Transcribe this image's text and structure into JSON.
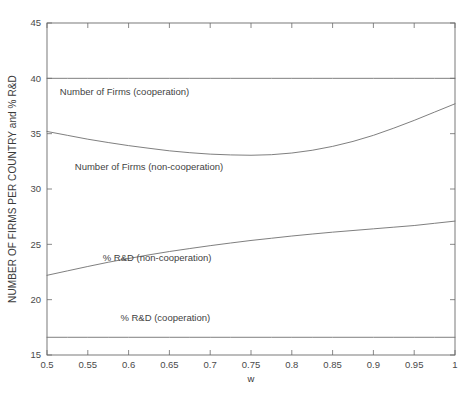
{
  "chart_data": {
    "type": "line",
    "title": "",
    "xlabel": "w",
    "ylabel": "NUMBER OF FIRMS PER COUNTRY and % R&D",
    "xlim": [
      0.5,
      1.0
    ],
    "ylim": [
      15,
      45
    ],
    "xticks": [
      0.5,
      0.55,
      0.6,
      0.65,
      0.7,
      0.75,
      0.8,
      0.85,
      0.9,
      0.95,
      1
    ],
    "xticklabels": [
      "0.5",
      "0.55",
      "0.6",
      "0.65",
      "0.7",
      "0.75",
      "0.8",
      "0.85",
      "0.9",
      "0.95",
      "1"
    ],
    "yticks": [
      15,
      20,
      25,
      30,
      35,
      40,
      45
    ],
    "yticklabels": [
      "15",
      "20",
      "25",
      "30",
      "35",
      "40",
      "45"
    ],
    "grid": false,
    "legend_position": "inline-annotations",
    "line_color": "#707070",
    "axis_color": "#6b6b6b",
    "background": "#ffffff",
    "x": [
      0.5,
      0.525,
      0.55,
      0.575,
      0.6,
      0.625,
      0.65,
      0.675,
      0.7,
      0.725,
      0.75,
      0.775,
      0.8,
      0.825,
      0.85,
      0.875,
      0.9,
      0.925,
      0.95,
      0.975,
      1.0
    ],
    "series": [
      {
        "name": "Number of Firms (cooperation)",
        "values": [
          40,
          40,
          40,
          40,
          40,
          40,
          40,
          40,
          40,
          40,
          40,
          40,
          40,
          40,
          40,
          40,
          40,
          40,
          40,
          40,
          40
        ],
        "annotation": {
          "text": "Number of Firms (cooperation)",
          "x": 0.595,
          "y": 38.45
        }
      },
      {
        "name": "Number of Firms (non-cooperation)",
        "values": [
          35.2,
          34.85,
          34.5,
          34.2,
          33.92,
          33.68,
          33.45,
          33.28,
          33.15,
          33.08,
          33.05,
          33.1,
          33.25,
          33.5,
          33.85,
          34.3,
          34.85,
          35.5,
          36.2,
          36.95,
          37.7
        ],
        "annotation": {
          "text": "Number of Firms (non-cooperation)",
          "x": 0.625,
          "y": 31.75
        }
      },
      {
        "name": "% R&D (non-cooperation)",
        "values": [
          22.2,
          22.6,
          23.0,
          23.38,
          23.72,
          24.05,
          24.35,
          24.62,
          24.88,
          25.12,
          25.35,
          25.55,
          25.75,
          25.93,
          26.1,
          26.25,
          26.4,
          26.55,
          26.7,
          26.9,
          27.1
        ],
        "annotation": {
          "text": "% R&D (non-cooperation)",
          "x": 0.635,
          "y": 23.45
        }
      },
      {
        "name": "% R&D (cooperation)",
        "values": [
          16.6,
          16.6,
          16.6,
          16.6,
          16.6,
          16.6,
          16.6,
          16.6,
          16.6,
          16.6,
          16.6,
          16.6,
          16.6,
          16.6,
          16.6,
          16.6,
          16.6,
          16.6,
          16.6,
          16.6,
          16.6
        ],
        "annotation": {
          "text": "% R&D (cooperation)",
          "x": 0.645,
          "y": 18.05
        }
      }
    ]
  }
}
